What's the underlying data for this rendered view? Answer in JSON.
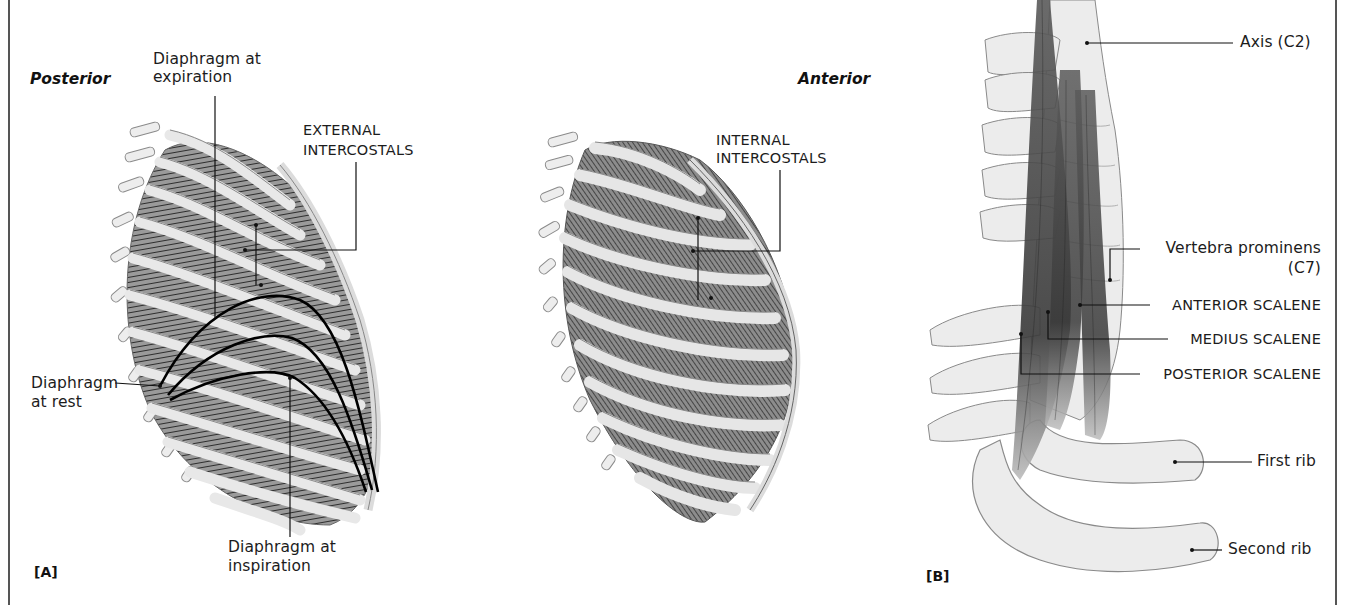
{
  "figure": {
    "panels": [
      {
        "id": "A",
        "tag": "[A]",
        "views": [
          {
            "heading": "Posterior",
            "labels": {
              "diaphragm_expiration_1": "Diaphragm at",
              "diaphragm_expiration_2": "expiration",
              "external_intercostals_1": "EXTERNAL",
              "external_intercostals_2": "INTERCOSTALS",
              "diaphragm_rest_1": "Diaphragm",
              "diaphragm_rest_2": "at rest",
              "diaphragm_inspiration_1": "Diaphragm at",
              "diaphragm_inspiration_2": "inspiration"
            }
          },
          {
            "heading": "Anterior",
            "labels": {
              "internal_intercostals_1": "INTERNAL",
              "internal_intercostals_2": "INTERCOSTALS"
            }
          }
        ]
      },
      {
        "id": "B",
        "tag": "[B]",
        "labels": {
          "axis": "Axis (C2)",
          "vertebra_prominens_1": "Vertebra prominens",
          "vertebra_prominens_2": "(C7)",
          "anterior_scalene": "ANTERIOR SCALENE",
          "medius_scalene": "MEDIUS SCALENE",
          "posterior_scalene": "POSTERIOR SCALENE",
          "first_rib": "First rib",
          "second_rib": "Second rib"
        }
      }
    ]
  },
  "colors": {
    "bone": "#ececec",
    "bone_outline": "#8a8a8a",
    "muscle": "#4a4a4a",
    "leader": "#111111",
    "frame": "#555555"
  }
}
